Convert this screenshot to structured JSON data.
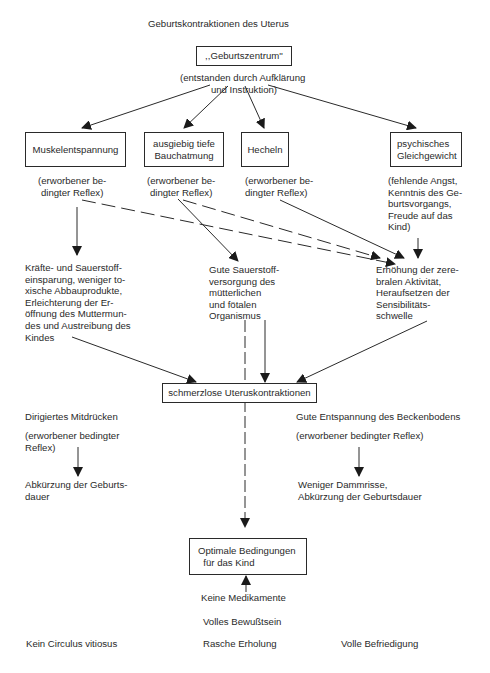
{
  "title": "Geburtskontraktionen des Uterus",
  "center": {
    "label": ",,Geburtszentrum''",
    "note": "(entstanden durch Aufklärung\n und Instruktion)"
  },
  "methods": [
    {
      "label": "Muskelentspannung",
      "note": "(erworbener be-\ndingter Reflex)"
    },
    {
      "label": "ausgiebig tiefe\nBauchatmung",
      "note": "(erworbener be-\ndingter Reflex)"
    },
    {
      "label": "Hecheln",
      "note": "(erworbener be-\ndingter Reflex)"
    },
    {
      "label": "psychisches\nGleichgewicht",
      "note": "(fehlende Angst,\nKenntnis des Ge-\nburtsvorgangs,\nFreude auf das\nKind)"
    }
  ],
  "effects": [
    {
      "text": "Kräfte- und Sauerstoff-\neinsparung, weniger to-\nxische Abbauprodukte,\nErleichterung der Er-\nöffnung des Muttermun-\ndes und Austreibung des\nKindes"
    },
    {
      "text": "Gute Sauerstoff-\nversorgung des\nmütterlichen\nund fötalen\nOrganismus"
    },
    {
      "text": "Erhöhung der zere-\nbralen Aktivität,\nHeraufsetzen der\nSensibilitäts-\nschwelle"
    }
  ],
  "result_box": "schmerzlose Uteruskontraktionen",
  "left_branch": {
    "title": "Dirigiertes Mitdrücken",
    "note": "(erworbener bedingter\nReflex)",
    "outcome": "Abkürzung der Geburts-\ndauer"
  },
  "right_branch": {
    "title": "Gute Entspannung des Beckenbodens",
    "note": "(erworbener bedingter Reflex)",
    "outcome": "Weniger Dammrisse,\nAbkürzung der Geburtsdauer"
  },
  "optimal_box": "Optimale Bedingungen\n  für das Kind",
  "bottom": {
    "no_medication": "Keine Medikamente",
    "full_consciousness": "Volles Bewußtsein",
    "items": [
      "Kein Circulus vitiosus",
      "Rasche Erholung",
      "Volle Befriedigung"
    ]
  }
}
